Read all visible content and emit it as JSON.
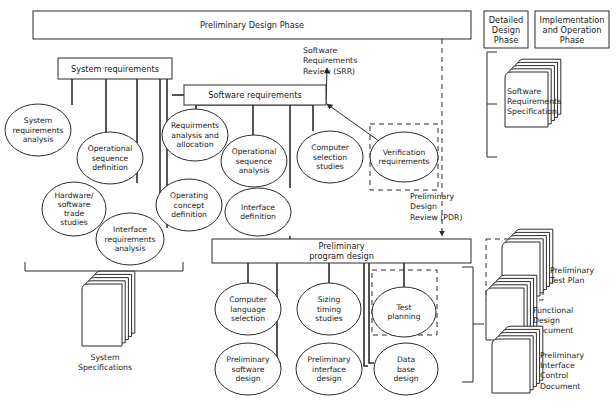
{
  "phases": [
    {
      "id": "preliminary-design-phase",
      "label": "Preliminary Design Phase",
      "x": 33,
      "y": 11,
      "w": 438,
      "h": 28,
      "lines": [
        "Preliminary Design Phase"
      ]
    },
    {
      "id": "detailed-design-phase",
      "label": "Detailed Design Phase",
      "x": 484,
      "y": 11,
      "w": 44,
      "h": 37,
      "lines": [
        "Detailed",
        "Design",
        "Phase"
      ]
    },
    {
      "id": "implementation-and-operation-phase",
      "label": "Implementation and Operation Phase",
      "x": 535,
      "y": 11,
      "w": 74,
      "h": 37,
      "lines": [
        "Implementation",
        "and Operation",
        "Phase"
      ]
    }
  ],
  "boxes": [
    {
      "id": "system-requirements",
      "x": 58,
      "y": 58,
      "w": 114,
      "h": 21,
      "lines": [
        "System requirements"
      ]
    },
    {
      "id": "software-requirements",
      "x": 184,
      "y": 85,
      "w": 142,
      "h": 20,
      "lines": [
        "Software requirements"
      ]
    },
    {
      "id": "preliminary-program-design",
      "x": 212,
      "y": 239,
      "w": 259,
      "h": 24,
      "lines": [
        "Preliminary",
        "program design"
      ]
    }
  ],
  "ellipses": [
    {
      "id": "system-requirements-analysis",
      "cx": 38,
      "cy": 130,
      "rx": 33,
      "ry": 26,
      "lines": [
        "System",
        "requirements",
        "analysis"
      ]
    },
    {
      "id": "operational-sequence-definition",
      "cx": 110,
      "cy": 158,
      "rx": 33,
      "ry": 26,
      "lines": [
        "Operational",
        "sequence",
        "definition"
      ]
    },
    {
      "id": "hardware-software-trade-studies",
      "cx": 74,
      "cy": 209,
      "rx": 32,
      "ry": 27,
      "lines": [
        "Hardware/",
        "software",
        "trade",
        "studies"
      ]
    },
    {
      "id": "interface-requirements-analysis",
      "cx": 130,
      "cy": 239,
      "rx": 34,
      "ry": 26,
      "lines": [
        "Interface",
        "requirements",
        "analysis"
      ]
    },
    {
      "id": "requirements-analysis-and-allocation",
      "cx": 195,
      "cy": 135,
      "rx": 33,
      "ry": 26,
      "lines": [
        "Requirments",
        "analysis and",
        "allocation"
      ]
    },
    {
      "id": "operating-concept-definition",
      "cx": 189,
      "cy": 205,
      "rx": 33,
      "ry": 26,
      "lines": [
        "Operating",
        "concept",
        "definition"
      ]
    },
    {
      "id": "operational-sequence-analysis",
      "cx": 254,
      "cy": 161,
      "rx": 33,
      "ry": 26,
      "lines": [
        "Operational",
        "sequence",
        "analysis"
      ]
    },
    {
      "id": "interface-definition",
      "cx": 258,
      "cy": 212,
      "rx": 33,
      "ry": 24,
      "lines": [
        "Interface",
        "definition"
      ]
    },
    {
      "id": "computer-selection-studies",
      "cx": 330,
      "cy": 157,
      "rx": 33,
      "ry": 26,
      "lines": [
        "Computer",
        "selection",
        "studies"
      ]
    },
    {
      "id": "verification-requirements",
      "cx": 404,
      "cy": 157,
      "rx": 34,
      "ry": 25,
      "lines": [
        "Verification",
        "requirements"
      ]
    },
    {
      "id": "computer-language-selection",
      "cx": 248,
      "cy": 309,
      "rx": 33,
      "ry": 26,
      "lines": [
        "Computer",
        "language",
        "selection"
      ]
    },
    {
      "id": "sizing-timing-studies",
      "cx": 329,
      "cy": 309,
      "rx": 32,
      "ry": 26,
      "lines": [
        "Sizing",
        "timing",
        "studies"
      ]
    },
    {
      "id": "test-planning",
      "cx": 404,
      "cy": 312,
      "rx": 32,
      "ry": 25,
      "lines": [
        "Test",
        "planning"
      ]
    },
    {
      "id": "preliminary-software-design",
      "cx": 248,
      "cy": 369,
      "rx": 33,
      "ry": 26,
      "lines": [
        "Preliminary",
        "software",
        "design"
      ]
    },
    {
      "id": "preliminary-interface-design",
      "cx": 329,
      "cy": 369,
      "rx": 33,
      "ry": 26,
      "lines": [
        "Preliminary",
        "interface",
        "design"
      ]
    },
    {
      "id": "data-base-design",
      "cx": 406,
      "cy": 369,
      "rx": 32,
      "ry": 26,
      "lines": [
        "Data",
        "base",
        "design"
      ]
    }
  ],
  "documents": [
    {
      "id": "software-requirements-specification",
      "x": 505,
      "y": 72,
      "w": 43,
      "h": 55,
      "sheets": 4,
      "label_x": 507,
      "label_y": 94,
      "lines": [
        "Software",
        "Requirements",
        "Specification"
      ],
      "label_inside": true
    },
    {
      "id": "system-specifications",
      "x": 82,
      "y": 284,
      "w": 40,
      "h": 62,
      "sheets": 4,
      "label_x": 105,
      "label_y": 360,
      "lines": [
        "System",
        "Specifications"
      ],
      "label_inside": false
    },
    {
      "id": "preliminary-test-plan",
      "x": 502,
      "y": 242,
      "w": 38,
      "h": 54,
      "sheets": 4,
      "label_x": 550,
      "label_y": 273,
      "lines": [
        "Preliminary",
        "Test Plan"
      ],
      "label_inside": false
    },
    {
      "id": "functional-design-document",
      "x": 486,
      "y": 288,
      "w": 38,
      "h": 52,
      "sheets": 4,
      "label_x": 533,
      "label_y": 313,
      "lines": [
        "Functional",
        "Design",
        "Document"
      ],
      "label_inside": false
    },
    {
      "id": "preliminary-interface-control-document",
      "x": 492,
      "y": 339,
      "w": 38,
      "h": 54,
      "sheets": 4,
      "label_x": 540,
      "label_y": 358,
      "lines": [
        "Preliminary",
        "Interface",
        "Control",
        "Document"
      ],
      "label_inside": false
    }
  ],
  "annotations": [
    {
      "id": "software-requirements-review-srr",
      "x": 303,
      "y": 53,
      "anchor": "start",
      "lines": [
        "Software",
        "Requirements",
        "Review (SRR)"
      ]
    },
    {
      "id": "preliminary-design-review-pdr",
      "x": 410,
      "y": 199,
      "anchor": "start",
      "lines": [
        "Preliminary",
        "Design",
        "Review (PDR)"
      ]
    }
  ],
  "colors": {
    "stroke": "#2b2b2b",
    "text": "#1a1a1a",
    "background": "#ffffff"
  }
}
